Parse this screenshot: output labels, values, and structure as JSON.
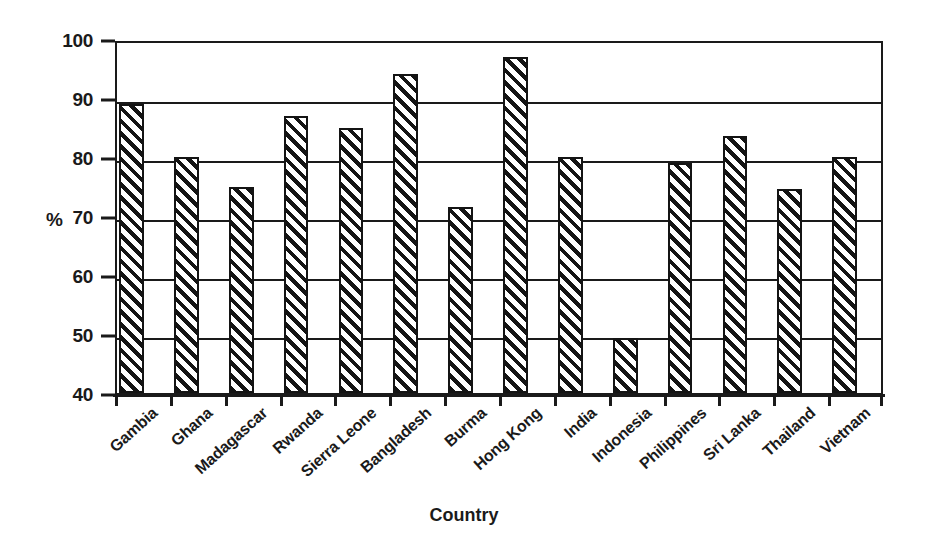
{
  "chart_data": {
    "type": "bar",
    "title": "",
    "xlabel": "Country",
    "ylabel": "%",
    "ylim": [
      40,
      100
    ],
    "ytick_step": 10,
    "yticks": [
      40,
      50,
      60,
      70,
      80,
      90,
      100
    ],
    "grid": true,
    "legend": "none",
    "bar_style": "diagonal-hatch",
    "colors": {
      "line": "#1a1a1a",
      "bar_fill": "#ffffff",
      "bar_hatch": "#141414",
      "background": "#ffffff"
    },
    "categories": [
      "Gambia",
      "Ghana",
      "Madagascar",
      "Rwanda",
      "Sierra Leone",
      "Bangladesh",
      "Burma",
      "Hong Kong",
      "India",
      "Indonesia",
      "Philippines",
      "Sri Lanka",
      "Thailand",
      "Vietnam"
    ],
    "values": [
      89,
      80,
      75,
      87,
      85,
      94,
      71.5,
      97,
      80,
      49.3,
      79,
      83.5,
      74.5,
      80
    ]
  }
}
